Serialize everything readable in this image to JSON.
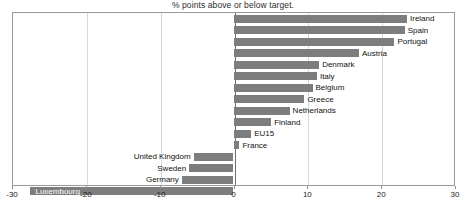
{
  "chart_data": {
    "type": "bar",
    "orientation": "horizontal",
    "title": "% points above or below target.",
    "xlabel": "",
    "ylabel": "",
    "xlim": [
      -30,
      30
    ],
    "xticks": [
      -30,
      -20,
      -10,
      0,
      10,
      20,
      30
    ],
    "xtick_labels": [
      "-30",
      "-20",
      "-10",
      "0",
      "10",
      "20",
      "30"
    ],
    "grid": true,
    "legend": false,
    "bar_color": "#7d7d7d",
    "categories": [
      "Ireland",
      "Spain",
      "Portugal",
      "Austria",
      "Denmark",
      "Italy",
      "Belgium",
      "Greece",
      "Netherlands",
      "Finland",
      "EU15",
      "France",
      "United Kingdom",
      "Sweden",
      "Germany",
      "Luxembourg"
    ],
    "values": [
      23.5,
      23.2,
      21.8,
      17.0,
      11.6,
      11.3,
      10.7,
      9.6,
      7.6,
      5.1,
      2.4,
      0.8,
      -5.4,
      -6.0,
      -7.0,
      -27.5
    ]
  }
}
